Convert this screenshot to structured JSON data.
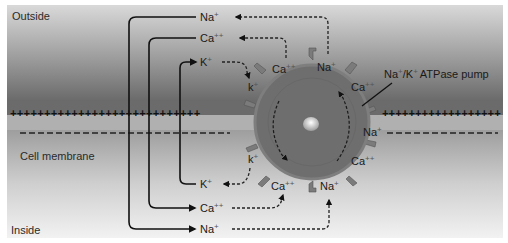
{
  "diagram": {
    "type": "membrane-ion-transport",
    "regions": {
      "outside": "Outside",
      "membrane": "Cell membrane",
      "inside": "Inside"
    },
    "membrane_charge": {
      "outer_sign": "+",
      "inner_sign": "-"
    },
    "pump": {
      "label": "Na",
      "label_sup": "+",
      "label_sep": "/K",
      "label_sup2": "+",
      "label_rest": "ATPase pump"
    },
    "outside_ions": [
      {
        "base": "Na",
        "sup": "+"
      },
      {
        "base": "Ca",
        "sup": "++"
      },
      {
        "base": "K",
        "sup": "+"
      }
    ],
    "inside_ions": [
      {
        "base": "K",
        "sup": "+"
      },
      {
        "base": "Ca",
        "sup": "++"
      },
      {
        "base": "Na",
        "sup": "+"
      }
    ],
    "pump_sites": [
      {
        "base": "Ca",
        "sup": "++",
        "position": "top-left"
      },
      {
        "base": "Na",
        "sup": "+",
        "position": "top"
      },
      {
        "base": "Ca",
        "sup": "++",
        "position": "upper-right"
      },
      {
        "base": "Na",
        "sup": "+",
        "position": "right"
      },
      {
        "base": "Ca",
        "sup": "++",
        "position": "lower-right"
      },
      {
        "base": "Na",
        "sup": "+",
        "position": "bottom"
      },
      {
        "base": "Ca",
        "sup": "++",
        "position": "bottom-left"
      },
      {
        "base": "k",
        "sup": "+",
        "position": "upper-left"
      },
      {
        "base": "k",
        "sup": "+",
        "position": "lower-left"
      }
    ],
    "colors": {
      "outside_top": "#8c8c8c",
      "outside_bottom": "#5f5f5f",
      "membrane_lower": "#a9a9a9",
      "inside_top": "#9a9a9a",
      "inside_bottom": "#ececec",
      "pump_fill": "#6e6e6e",
      "pump_rim": "#7a7a7a",
      "line": "#111111"
    }
  }
}
